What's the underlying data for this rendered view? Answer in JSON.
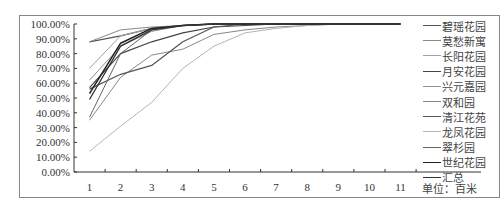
{
  "chart_data": {
    "type": "line",
    "title": "",
    "xlabel": "",
    "ylabel": "",
    "unit_label": "单位：百米",
    "x": [
      1,
      2,
      3,
      4,
      5,
      6,
      7,
      8,
      9,
      10,
      11
    ],
    "ylim": [
      0,
      100
    ],
    "y_ticks": [
      "0.00%",
      "10.00%",
      "20.00%",
      "30.00%",
      "40.00%",
      "50.00%",
      "60.00%",
      "70.00%",
      "80.00%",
      "90.00%",
      "100.00%"
    ],
    "grid": false,
    "legend_position": "right",
    "series": [
      {
        "name": "碧瑶花园",
        "color": "#555555",
        "width": 1.2,
        "values": [
          88,
          92,
          97,
          99,
          100,
          100,
          100,
          100,
          100,
          100,
          100
        ]
      },
      {
        "name": "莫愁新寓",
        "color": "#8a8a8a",
        "width": 1.0,
        "values": [
          88,
          96,
          98,
          99,
          100,
          100,
          100,
          100,
          100,
          100,
          100
        ]
      },
      {
        "name": "长阳花园",
        "color": "#a0a0a0",
        "width": 1.0,
        "values": [
          70,
          92,
          97,
          99,
          100,
          100,
          100,
          100,
          100,
          100,
          100
        ]
      },
      {
        "name": "月安花园",
        "color": "#444444",
        "width": 1.2,
        "values": [
          57,
          80,
          88,
          94,
          98,
          99,
          100,
          100,
          100,
          100,
          100
        ]
      },
      {
        "name": "兴元嘉园",
        "color": "#909090",
        "width": 1.0,
        "values": [
          62,
          85,
          95,
          99,
          100,
          100,
          100,
          100,
          100,
          100,
          100
        ]
      },
      {
        "name": "双和园",
        "color": "#888888",
        "width": 1.0,
        "values": [
          35,
          64,
          79,
          83,
          93,
          96,
          98,
          99,
          100,
          100,
          100
        ]
      },
      {
        "name": "清江花苑",
        "color": "#555555",
        "width": 1.2,
        "values": [
          56,
          66,
          72,
          88,
          98,
          100,
          100,
          100,
          100,
          100,
          100
        ]
      },
      {
        "name": "龙凤花园",
        "color": "#b5b5b5",
        "width": 1.0,
        "values": [
          14,
          31,
          47,
          70,
          85,
          94,
          97,
          99,
          100,
          100,
          100
        ]
      },
      {
        "name": "翠杉园",
        "color": "#666666",
        "width": 1.0,
        "values": [
          37,
          80,
          96,
          99,
          100,
          100,
          100,
          100,
          100,
          100,
          100
        ]
      },
      {
        "name": "世纪花园",
        "color": "#222222",
        "width": 1.5,
        "values": [
          53,
          87,
          97,
          99,
          100,
          100,
          100,
          100,
          100,
          100,
          100
        ]
      },
      {
        "name": "汇总",
        "color": "#333333",
        "width": 1.3,
        "values": [
          49,
          85,
          96,
          99,
          100,
          100,
          100,
          100,
          100,
          100,
          100
        ]
      }
    ]
  },
  "legend": {
    "items": [
      "碧瑶花园",
      "莫愁新寓",
      "长阳花园",
      "月安花园",
      "兴元嘉园",
      "双和园",
      "清江花苑",
      "龙凤花园",
      "翠杉园",
      "世纪花园",
      "汇总"
    ]
  }
}
